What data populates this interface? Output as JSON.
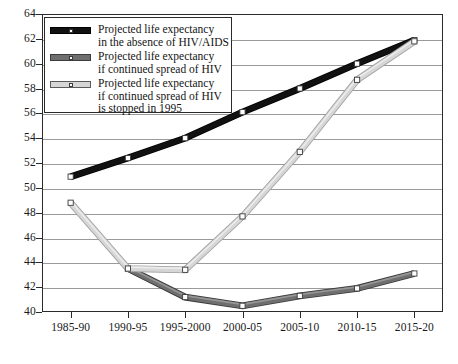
{
  "chart_data": {
    "type": "line",
    "title": "",
    "subtitle": "",
    "xlabel": "",
    "ylabel": "",
    "categories": [
      "1985-90",
      "1990-95",
      "1995-2000",
      "2000-05",
      "2005-10",
      "2010-15",
      "2015-20"
    ],
    "ylim": [
      40,
      64
    ],
    "ytick_values": [
      40,
      42,
      44,
      46,
      48,
      50,
      52,
      54,
      56,
      58,
      60,
      62,
      64
    ],
    "ytick_labels": [
      "40",
      "42",
      "44",
      "46",
      "48",
      "50",
      "52",
      "54",
      "56",
      "58",
      "60",
      "62",
      "64"
    ],
    "grid": true,
    "grid_axis": "y",
    "legend_position": "upper-left-inside",
    "series": [
      {
        "name": "Projected life expectancy in the absence of HIV/AIDS",
        "legend_lines": [
          "Projected life expectancy",
          "in the absence of HIV/AIDS"
        ],
        "color": "#111111",
        "marker": "square-white",
        "x": [
          "1985-90",
          "1990-95",
          "1995-2000",
          "2000-05",
          "2005-10",
          "2010-15",
          "2015-20"
        ],
        "values": [
          50.9,
          52.4,
          54.0,
          56.1,
          58.0,
          60.0,
          61.9
        ]
      },
      {
        "name": "Projected life expectancy if continued spread of HIV",
        "legend_lines": [
          "Projected life expectancy",
          "if continued spread of HIV"
        ],
        "color": "#6f6f6f",
        "marker": "square-white",
        "x": [
          "1990-95",
          "1995-2000",
          "2000-05",
          "2005-10",
          "2010-15",
          "2015-20"
        ],
        "values": [
          43.5,
          41.2,
          40.5,
          41.3,
          41.9,
          43.1
        ]
      },
      {
        "name": "Projected life expectancy if continued spread of HIV is stopped in 1995",
        "legend_lines": [
          "Projected life expectancy",
          "if continued spread of HIV",
          "is stopped in 1995"
        ],
        "color": "#d6d6d6",
        "marker": "square-white",
        "x": [
          "1985-90",
          "1990-95",
          "1995-2000",
          "2000-05",
          "2005-10",
          "2010-15",
          "2015-20"
        ],
        "values": [
          48.8,
          43.5,
          43.4,
          47.7,
          52.9,
          58.7,
          61.8
        ]
      }
    ]
  },
  "colors": {
    "axis": "#2b2b2b",
    "grid": "#9a9a9a",
    "background": "#ffffff",
    "series_black": "#111111",
    "series_dark_gray": "#6f6f6f",
    "series_light_gray": "#d6d6d6"
  }
}
